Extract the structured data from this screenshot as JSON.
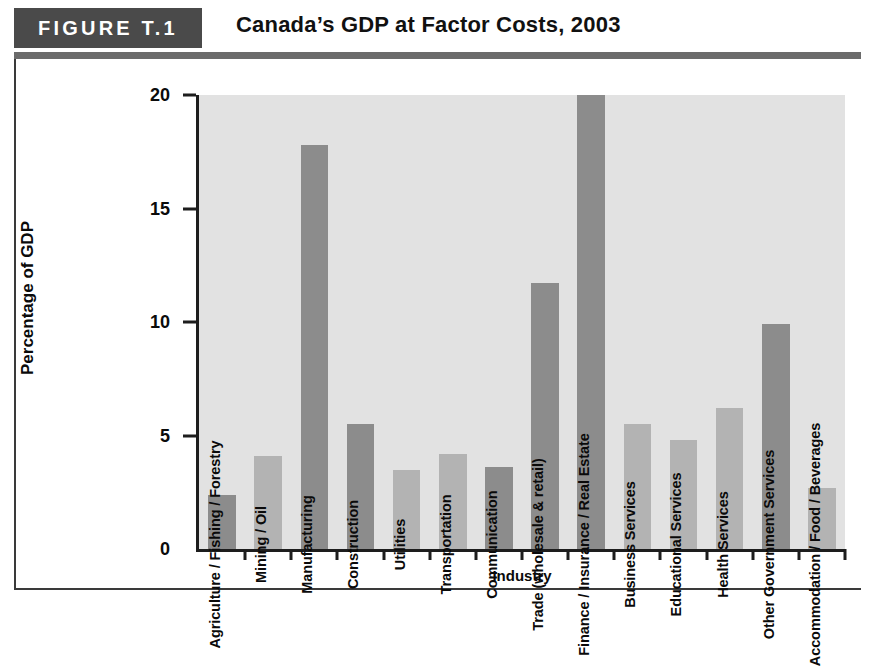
{
  "header": {
    "figure_tag": "FIGURE T.1",
    "title": "Canada’s GDP at Factor Costs, 2003"
  },
  "colors": {
    "tag_background": "#4a4a4a",
    "rule": "#6b6b6b",
    "plot_background": "#e2e2e2",
    "bar_dark": "#8c8c8c",
    "bar_light": "#b3b3b3",
    "axis": "#1d1d1d",
    "text": "#0a0a0a"
  },
  "chart_data": {
    "type": "bar",
    "title": "Canada’s GDP at Factor Costs, 2003",
    "xlabel": "Industry",
    "ylabel": "Percentage of GDP",
    "ylim": [
      0,
      20
    ],
    "yticks": [
      0,
      5,
      10,
      15,
      20
    ],
    "ytick_labels": [
      "0",
      "5",
      "10",
      "15",
      "20"
    ],
    "grid": false,
    "legend": "none",
    "note": "Finance / Insurance / Real Estate bar is clipped at the top of the 20% axis",
    "categories": [
      "Agriculture / Fishing / Forestry",
      "Mining / Oil",
      "Manufacturing",
      "Construction",
      "Utilities",
      "Transportation",
      "Communication",
      "Trade (wholesale & retail)",
      "Finance / Insurance / Real Estate",
      "Business Services",
      "Educational Services",
      "Health Services",
      "Other Government Services",
      "Accommodation / Food / Beverages"
    ],
    "values": [
      2.4,
      4.1,
      17.8,
      5.5,
      3.5,
      4.2,
      3.6,
      11.7,
      20.0,
      5.5,
      4.8,
      6.2,
      9.9,
      2.7
    ],
    "shades": [
      "dark",
      "light",
      "dark",
      "dark",
      "light",
      "light",
      "dark",
      "dark",
      "dark",
      "light",
      "light",
      "light",
      "dark",
      "light"
    ]
  }
}
